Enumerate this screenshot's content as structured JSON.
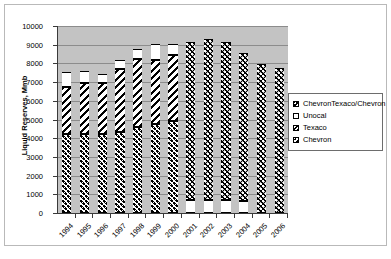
{
  "chart_data": {
    "type": "bar",
    "subtype": "stacked-column",
    "title": "",
    "xlabel": "",
    "ylabel": "Liquid Reserves, Mmb",
    "ylim": [
      0,
      10000
    ],
    "ytick_values": [
      0,
      1000,
      2000,
      3000,
      4000,
      5000,
      6000,
      7000,
      8000,
      9000,
      10000
    ],
    "ytick_labels": [
      "0",
      "1000",
      "2000",
      "3000",
      "4000",
      "5000",
      "6000",
      "7000",
      "8000",
      "9000",
      "10000"
    ],
    "grid": true,
    "grid_axis": "y",
    "legend_position": "right",
    "plot_background": "#c3c3c3",
    "categories": [
      "1994",
      "1995",
      "1996",
      "1997",
      "1998",
      "1999",
      "2000",
      "2001",
      "2002",
      "2003",
      "2004",
      "2005",
      "2006"
    ],
    "series": [
      {
        "name": "Chevron",
        "pattern": "dotted-on-white",
        "values": [
          4200,
          4250,
          4250,
          4350,
          4600,
          4750,
          4900,
          null,
          null,
          null,
          null,
          null,
          null
        ]
      },
      {
        "name": "Texaco",
        "pattern": "diagonal-hatch",
        "values": [
          2550,
          2700,
          2700,
          3350,
          3650,
          3450,
          3550,
          null,
          null,
          null,
          null,
          null,
          null
        ]
      },
      {
        "name": "Unocal",
        "pattern": "solid-white",
        "values": [
          800,
          650,
          500,
          500,
          500,
          850,
          600,
          700,
          680,
          680,
          640,
          null,
          null
        ]
      },
      {
        "name": "ChevronTexaco/Chevron",
        "pattern": "dotted-on-black",
        "values": [
          null,
          null,
          null,
          null,
          null,
          null,
          null,
          8450,
          8620,
          8470,
          7910,
          7950,
          7750
        ]
      }
    ],
    "stack_order": [
      "Chevron",
      "Texaco",
      "Unocal"
    ],
    "stack_order_later": [
      "Unocal",
      "ChevronTexaco/Chevron"
    ],
    "bar_totals": [
      7550,
      7600,
      7450,
      8200,
      8750,
      9050,
      9050,
      9150,
      9300,
      9150,
      8550,
      7950,
      7750
    ]
  },
  "legend": {
    "items": [
      {
        "label": "ChevronTexaco/Chevron",
        "swatch": "ctc-swatch-icon"
      },
      {
        "label": "Unocal",
        "swatch": "unocal-swatch-icon"
      },
      {
        "label": "Texaco",
        "swatch": "texaco-swatch-icon"
      },
      {
        "label": "Chevron",
        "swatch": "chevron-swatch-icon"
      }
    ]
  },
  "colors": {
    "plot_background": "#c3c3c3",
    "gridline": "#8c8c8c",
    "axis": "#3a3a3a",
    "series_dark": "#000000",
    "page_background": "#ffffff"
  }
}
